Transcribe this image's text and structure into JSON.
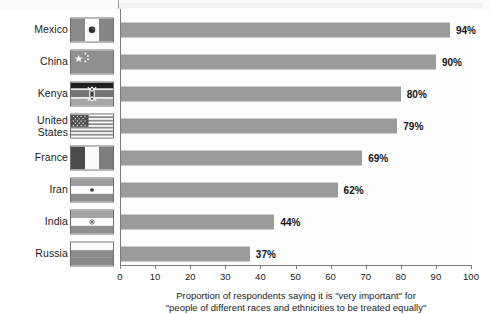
{
  "chart_data": {
    "type": "bar",
    "orientation": "horizontal",
    "title": "",
    "xlabel": "Proportion of respondents saying it is \"very important\" for \"people of different races and ethnicities to be treated equally\"",
    "ylabel": "",
    "xlim": [
      0,
      100
    ],
    "xticks": [
      0,
      10,
      20,
      30,
      40,
      50,
      60,
      70,
      80,
      90,
      100
    ],
    "grid": false,
    "legend": "none",
    "bar_color": "#9b9b9b",
    "categories": [
      "Mexico",
      "China",
      "Kenya",
      "United States",
      "France",
      "Iran",
      "India",
      "Russia"
    ],
    "values": [
      94,
      90,
      80,
      79,
      69,
      62,
      44,
      37
    ],
    "value_labels": [
      "94%",
      "90%",
      "80%",
      "79%",
      "69%",
      "62%",
      "44%",
      "37%"
    ],
    "caption_line_1": "Proportion of respondents saying it is \"very important\" for",
    "caption_line_2": "\"people of different races and ethnicities to be treated equally\""
  },
  "rows": [
    {
      "country": "Mexico",
      "label_line_1": "Mexico",
      "label_line_2": "",
      "value": 94,
      "value_label": "94%",
      "flag": "flag-mexico"
    },
    {
      "country": "China",
      "label_line_1": "China",
      "label_line_2": "",
      "value": 90,
      "value_label": "90%",
      "flag": "flag-china"
    },
    {
      "country": "Kenya",
      "label_line_1": "Kenya",
      "label_line_2": "",
      "value": 80,
      "value_label": "80%",
      "flag": "flag-kenya"
    },
    {
      "country": "United States",
      "label_line_1": "United",
      "label_line_2": "States",
      "value": 79,
      "value_label": "79%",
      "flag": "flag-united-states"
    },
    {
      "country": "France",
      "label_line_1": "France",
      "label_line_2": "",
      "value": 69,
      "value_label": "69%",
      "flag": "flag-france"
    },
    {
      "country": "Iran",
      "label_line_1": "Iran",
      "label_line_2": "",
      "value": 62,
      "value_label": "62%",
      "flag": "flag-iran"
    },
    {
      "country": "India",
      "label_line_1": "India",
      "label_line_2": "",
      "value": 44,
      "value_label": "44%",
      "flag": "flag-india"
    },
    {
      "country": "Russia",
      "label_line_1": "Russia",
      "label_line_2": "",
      "value": 37,
      "value_label": "37%",
      "flag": "flag-russia"
    }
  ],
  "axis": {
    "ticks": [
      "0",
      "10",
      "20",
      "30",
      "40",
      "50",
      "60",
      "70",
      "80",
      "90",
      "100"
    ]
  }
}
